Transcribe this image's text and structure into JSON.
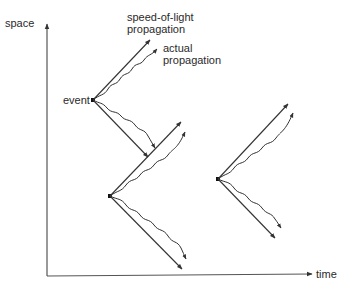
{
  "diagram": {
    "title": "",
    "axes": {
      "y_label": "space",
      "x_label": "time"
    },
    "labels": {
      "speed_of_light_line1": "speed-of-light",
      "speed_of_light_line2": "propagation",
      "actual_line1": "actual",
      "actual_line2": "propagation",
      "event": "event"
    },
    "events": [
      {
        "id": "event-1",
        "x": 93,
        "y": 100,
        "labeled": true
      },
      {
        "id": "event-2",
        "x": 110,
        "y": 196,
        "labeled": false
      },
      {
        "id": "event-3",
        "x": 218,
        "y": 179,
        "labeled": false
      }
    ],
    "colors": {
      "line": "#333333",
      "axis": "#555555",
      "text": "#2a2a2a",
      "background": "#ffffff"
    }
  }
}
